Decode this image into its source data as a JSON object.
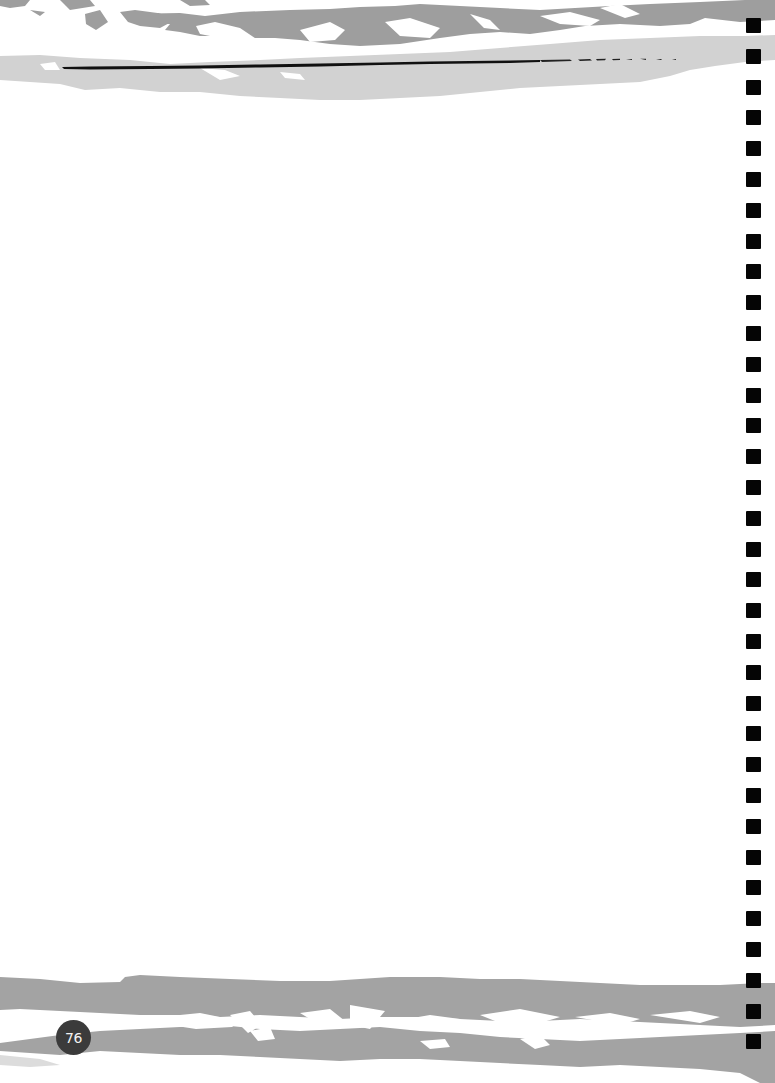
{
  "page": {
    "page_number": "76",
    "background": "#ffffff"
  },
  "decor": {
    "top_band": {
      "dark_stroke_color": "#9e9e9e",
      "light_stroke_color": "#d2d2d2",
      "rule_color": "#111111"
    },
    "bottom_band": {
      "stroke_color": "#a3a3a3"
    },
    "binder_holes": {
      "count": 34,
      "color": "#050505",
      "start_y": 18,
      "pitch": 30.8,
      "size": 15
    },
    "page_badge_color": "#3b3b3b"
  },
  "content": {
    "body_text": ""
  }
}
